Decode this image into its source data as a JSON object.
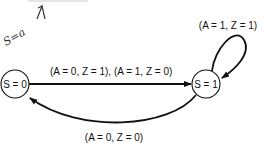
{
  "diagram": {
    "type": "state-diagram",
    "annotation": {
      "handwritten_text": "S=a",
      "arrow": "up-arrow"
    },
    "states": [
      {
        "id": "s0",
        "label": "S = 0"
      },
      {
        "id": "s1",
        "label": "S = 1"
      }
    ],
    "transitions": [
      {
        "from": "s0",
        "to": "s1",
        "label": "(A = 0, Z = 1), (A = 1, Z = 0)"
      },
      {
        "from": "s1",
        "to": "s1",
        "label": "(A = 1, Z = 1)"
      },
      {
        "from": "s1",
        "to": "s0",
        "label": "(A = 0, Z = 0)"
      }
    ],
    "colors": {
      "stroke": "#111111",
      "background": "#ffffff"
    }
  }
}
